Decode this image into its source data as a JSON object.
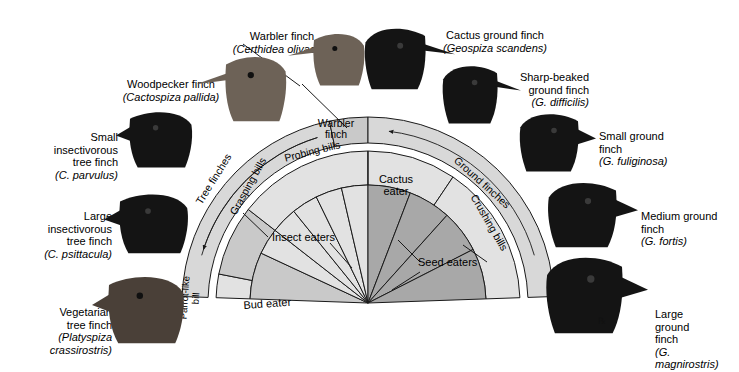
{
  "figure": {
    "type": "radial-fan-diagram"
  },
  "chart_data": {
    "type": "pie",
    "xlabel": "",
    "ylabel": "",
    "legend_position": "none",
    "grid": false,
    "rings": [
      {
        "name": "species-ring",
        "radius_range": [
          160,
          186
        ],
        "segments": [
          {
            "label": "Warbler finch",
            "shade": "mid"
          }
        ]
      },
      {
        "name": "group-ring",
        "radius_range": [
          160,
          186
        ],
        "segments": [
          {
            "label": "Tree finches",
            "shade": "light"
          },
          {
            "label": "Ground finches",
            "shade": "light"
          }
        ]
      },
      {
        "name": "bill-ring",
        "radius_range": [
          118,
          152
        ],
        "segments": [
          {
            "label": "Parrot-like bill",
            "shade": "light"
          },
          {
            "label": "Grasping bills",
            "shade": "mid"
          },
          {
            "label": "Probing bills",
            "shade": "light"
          },
          {
            "label": "Crushing bills",
            "shade": "light"
          }
        ]
      },
      {
        "name": "diet-core",
        "radius_range": [
          0,
          118
        ],
        "segments": [
          {
            "label": "Bud eater",
            "shade": "mid",
            "sectors": 1
          },
          {
            "label": "Insect eaters",
            "shade": "light",
            "sectors": 4
          },
          {
            "label": "Cactus eater",
            "shade": "light",
            "sectors": 1
          },
          {
            "label": "Seed eaters",
            "shade": "dark",
            "sectors": 4
          }
        ]
      }
    ],
    "categories": [
      "Bud eater",
      "Insect eaters",
      "Cactus eater",
      "Seed eaters"
    ],
    "values": [
      1,
      4,
      1,
      4
    ]
  },
  "fan_labels": {
    "warbler_finch": "Warbler\nfinch",
    "tree_finches": "Tree finches",
    "ground_finches": "Ground finches",
    "probing_bills": "Probing bills",
    "grasping_bills": "Grasping bills",
    "crushing_bills": "Crushing bills",
    "parrot_like_bill": "Parrot-like\nbill",
    "bud_eater": "Bud eater",
    "insect_eaters": "Insect eaters",
    "cactus_eater": "Cactus\neater",
    "seed_eaters": "Seed eaters"
  },
  "species": [
    {
      "id": "warbler-finch",
      "common": "Warbler finch",
      "scientific": "(Certhidea olivacea)",
      "align": "center"
    },
    {
      "id": "woodpecker-finch",
      "common": "Woodpecker finch",
      "scientific": "(Cactospiza pallida)",
      "align": "center"
    },
    {
      "id": "small-insectivorous-tree-finch",
      "common": "Small\ninsectivorous\ntree finch",
      "scientific": "(C. parvulus)",
      "align": "right"
    },
    {
      "id": "large-insectivorous-tree-finch",
      "common": "Large\ninsectivorous\ntree finch",
      "scientific": "(C. psittacula)",
      "align": "right"
    },
    {
      "id": "vegetarian-tree-finch",
      "common": "Vegetarian\ntree finch",
      "scientific": "(Platyspiza\ncrassirostris)",
      "align": "right"
    },
    {
      "id": "cactus-ground-finch",
      "common": "Cactus ground finch",
      "scientific": "(Geospiza scandens)",
      "align": "center"
    },
    {
      "id": "sharp-beaked-ground-finch",
      "common": "Sharp-beaked\nground finch",
      "scientific": "(G. difficilis)",
      "align": "right"
    },
    {
      "id": "small-ground-finch",
      "common": "Small ground\nfinch",
      "scientific": "(G. fuliginosa)",
      "align": "left"
    },
    {
      "id": "medium-ground-finch",
      "common": "Medium ground\nfinch",
      "scientific": "(G. fortis)",
      "align": "left"
    },
    {
      "id": "large-ground-finch",
      "common": "Large\nground\nfinch",
      "scientific": "(G.\nmagnirostris)",
      "align": "left"
    }
  ],
  "colors": {
    "background": "#ffffff",
    "stroke": "#1a1a1a",
    "shade_light": "#e2e2e2",
    "shade_mid": "#c9c9c9",
    "shade_dark": "#a8a8a8",
    "shade_band": "#d8d8d8",
    "bird_dark": "#141414",
    "bird_brown": "#6d6257"
  }
}
